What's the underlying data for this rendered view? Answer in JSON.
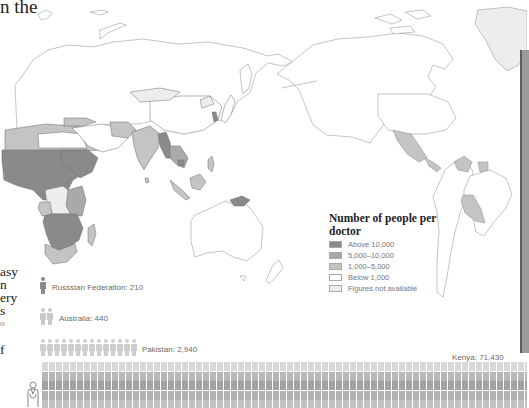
{
  "intro_text": {
    "top_fragment": "n the",
    "side_fragments": [
      "asy",
      "n",
      "ery",
      "s",
      "o",
      "",
      "f"
    ]
  },
  "legend": {
    "title": "Number of people per doctor",
    "items": [
      {
        "label": "Above 10,000",
        "color": "#8a8a8a"
      },
      {
        "label": "5,000–10,000",
        "color": "#a9a9a9"
      },
      {
        "label": "1,000–5,000",
        "color": "#c4c4c4"
      },
      {
        "label": "Below 1,000",
        "color": "#ffffff"
      },
      {
        "label": "Figures not available",
        "color": "#ededed"
      }
    ]
  },
  "pictogram": {
    "rows": [
      {
        "country": "Russsian Federation",
        "value": "210",
        "label": "Russsian Federation: 210",
        "icons": 1,
        "color": "#8a8a8a"
      },
      {
        "country": "Australia",
        "value": "440",
        "label": "Australia: 440",
        "icons": 2,
        "color": "#c9c9c9"
      },
      {
        "country": "Pakistan",
        "value": "2,940",
        "label": "Pakistan: 2,940",
        "icons": 14,
        "color": "#cfcfcf"
      }
    ],
    "kenya": {
      "country": "Kenya",
      "value": "71,430",
      "label": "Kenya: 71,430"
    }
  },
  "colors": {
    "above_10000": "#8a8a8a",
    "c5000_10000": "#a9a9a9",
    "c1000_5000": "#c4c4c4",
    "below_1000": "#ffffff",
    "not_available": "#ededed",
    "border": "#7a7a7a"
  }
}
